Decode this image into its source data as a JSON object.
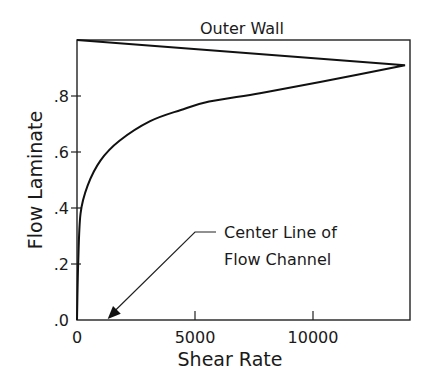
{
  "chart_data": {
    "type": "line",
    "title": "Outer Wall",
    "xlabel": "Shear Rate",
    "ylabel": "Flow Laminate",
    "xlim": [
      0,
      14200
    ],
    "ylim": [
      0,
      1.0
    ],
    "x_ticks": [
      {
        "value": 0,
        "label": "0"
      },
      {
        "value": 5000,
        "label": "5000"
      },
      {
        "value": 10000,
        "label": "10000"
      }
    ],
    "y_ticks": [
      {
        "value": 0.0,
        "label": ".0"
      },
      {
        "value": 0.2,
        "label": ".2"
      },
      {
        "value": 0.4,
        "label": ".4"
      },
      {
        "value": 0.6,
        "label": ".6"
      },
      {
        "value": 0.8,
        "label": ".8"
      }
    ],
    "grid": false,
    "legend": null,
    "series": [
      {
        "name": "Shear rate profile",
        "x": [
          0,
          50,
          150,
          450,
          1000,
          1800,
          3100,
          4400,
          5600,
          7750,
          10300,
          13900,
          0
        ],
        "y": [
          0.0,
          0.2,
          0.38,
          0.48,
          0.57,
          0.64,
          0.71,
          0.75,
          0.78,
          0.81,
          0.85,
          0.91,
          1.0
        ]
      }
    ],
    "annotations": [
      {
        "text_lines": [
          "Center Line of",
          "Flow Channel"
        ],
        "arrow_to": {
          "x": 1300,
          "y": 0.0
        }
      }
    ]
  }
}
